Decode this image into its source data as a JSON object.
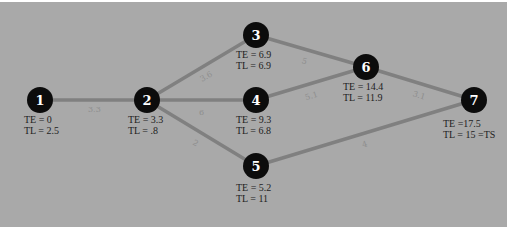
{
  "diagram": {
    "type": "PERT network",
    "background_color": "#a9a9a9",
    "nodes": [
      {
        "id": "1",
        "x": 40,
        "y": 100,
        "te": "TE = 0",
        "tl": "TL = 2.5"
      },
      {
        "id": "2",
        "x": 147,
        "y": 100,
        "te": "TE = 3.3",
        "tl": "TL = .8"
      },
      {
        "id": "3",
        "x": 256,
        "y": 35,
        "te": "TE = 6.9",
        "tl": "TL = 6.9"
      },
      {
        "id": "4",
        "x": 256,
        "y": 100,
        "te": "TE = 9.3",
        "tl": "TL = 6.8"
      },
      {
        "id": "5",
        "x": 256,
        "y": 166,
        "te": "TE = 5.2",
        "tl": "TL = 11"
      },
      {
        "id": "6",
        "x": 366,
        "y": 67,
        "te": "TE = 14.4",
        "tl": "TL = 11.9"
      },
      {
        "id": "7",
        "x": 474,
        "y": 100,
        "te": "TE =17.5",
        "tl": "TL = 15 =TS"
      }
    ],
    "edges": [
      {
        "from": "1",
        "to": "2",
        "label": "3.3"
      },
      {
        "from": "2",
        "to": "3",
        "label": "3.6"
      },
      {
        "from": "2",
        "to": "4",
        "label": "6"
      },
      {
        "from": "2",
        "to": "5",
        "label": "2"
      },
      {
        "from": "3",
        "to": "6",
        "label": "5"
      },
      {
        "from": "4",
        "to": "6",
        "label": "5.1"
      },
      {
        "from": "6",
        "to": "7",
        "label": "3.1"
      },
      {
        "from": "5",
        "to": "7",
        "label": "4"
      }
    ]
  }
}
